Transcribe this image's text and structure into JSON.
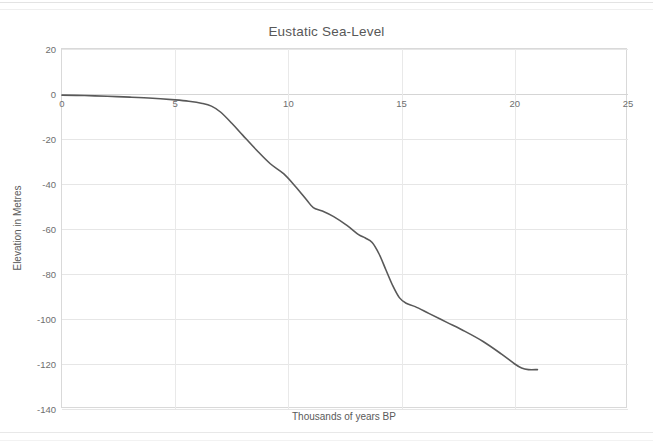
{
  "page": {
    "background_color": "#ffffff",
    "rule_color": "#e3e3e3"
  },
  "chart": {
    "title": "Eustatic Sea-Level",
    "x_axis_title": "Thousands of years BP",
    "y_axis_title": "Elevation in Metres",
    "line_color": "#595959",
    "grid_color": "#e6e6e6",
    "plot_border_color": "#d9d9d9",
    "x_ticks": [
      "0",
      "5",
      "10",
      "15",
      "20",
      "25"
    ],
    "y_ticks": [
      "20",
      "0",
      "-20",
      "-40",
      "-60",
      "-80",
      "-100",
      "-120",
      "-140"
    ]
  },
  "chart_data": {
    "type": "line",
    "title": "Eustatic Sea-Level",
    "xlabel": "Thousands of years BP",
    "ylabel": "Elevation in Metres",
    "xlim": [
      0,
      25
    ],
    "ylim": [
      -140,
      20
    ],
    "xticks": [
      0,
      5,
      10,
      15,
      20,
      25
    ],
    "yticks": [
      20,
      0,
      -20,
      -40,
      -60,
      -80,
      -100,
      -120,
      -140
    ],
    "grid": true,
    "legend": false,
    "series": [
      {
        "name": "Eustatic sea level",
        "color": "#595959",
        "x": [
          0.0,
          1.0,
          2.0,
          3.0,
          4.0,
          5.0,
          5.6,
          6.2,
          6.6,
          7.0,
          7.5,
          8.0,
          8.6,
          9.2,
          9.8,
          10.3,
          10.8,
          11.1,
          11.5,
          12.0,
          12.6,
          13.1,
          13.4,
          13.7,
          14.0,
          14.3,
          14.6,
          14.9,
          15.2,
          15.6,
          16.2,
          17.0,
          17.8,
          18.6,
          19.4,
          20.0,
          20.3,
          20.6,
          21.0
        ],
        "y": [
          -0.5,
          -0.7,
          -1.0,
          -1.4,
          -1.9,
          -2.6,
          -3.2,
          -4.2,
          -5.4,
          -8.0,
          -13.0,
          -18.5,
          -25.0,
          -31.0,
          -35.5,
          -41.0,
          -47.0,
          -50.5,
          -52.0,
          -54.5,
          -58.5,
          -62.5,
          -64.0,
          -66.0,
          -71.0,
          -78.0,
          -85.0,
          -90.5,
          -93.0,
          -94.5,
          -97.5,
          -101.5,
          -105.5,
          -110.0,
          -115.5,
          -120.0,
          -121.8,
          -122.5,
          -122.5
        ]
      }
    ]
  }
}
